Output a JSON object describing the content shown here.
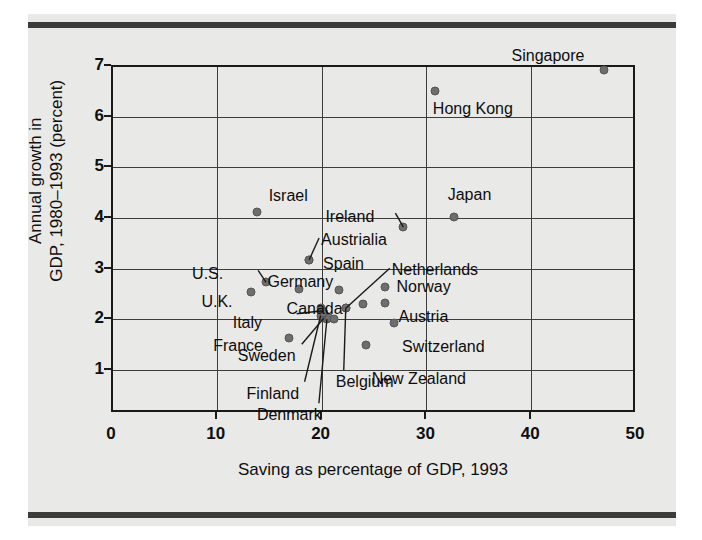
{
  "chart_data": {
    "type": "scatter",
    "title": "",
    "xlabel": "Saving as percentage of GDP, 1993",
    "ylabel": "Annual growth in\nGDP, 1980–1993 (percent)",
    "ylabel_line1": "Annual growth in",
    "ylabel_line2": "GDP, 1980–1993 (percent)",
    "xlim": [
      0,
      50
    ],
    "ylim": [
      0.15,
      7
    ],
    "xticks": [
      0,
      10,
      20,
      30,
      40,
      50
    ],
    "yticks": [
      1,
      2,
      3,
      4,
      5,
      6,
      7
    ],
    "xtick_labels": [
      "0",
      "10",
      "20",
      "30",
      "40",
      "50"
    ],
    "ytick_labels": [
      "1",
      "2",
      "3",
      "4",
      "5",
      "6",
      "7"
    ],
    "grid": true,
    "legend": "none",
    "points": [
      {
        "name": "Singapore",
        "x": 47.0,
        "y": 6.9,
        "label_dx": -92,
        "label_dy": -22,
        "leader": false
      },
      {
        "name": "Hong Kong",
        "x": 30.9,
        "y": 6.48,
        "label_dx": -2,
        "label_dy": 10,
        "leader": false
      },
      {
        "name": "Japan",
        "x": 32.7,
        "y": 4.0,
        "label_dx": -6,
        "label_dy": -30,
        "leader": false
      },
      {
        "name": "Ireland",
        "x": 27.9,
        "y": 3.8,
        "label_dx": -78,
        "label_dy": -18,
        "leader": true,
        "lx": -8,
        "ly": -14
      },
      {
        "name": "Netherlands",
        "x": 22.4,
        "y": 2.2,
        "label_dx": 46,
        "label_dy": -46,
        "leader": true,
        "lx": 44,
        "ly": -40
      },
      {
        "name": "Austrialia",
        "x": 18.9,
        "y": 3.15,
        "label_dx": 12,
        "label_dy": -28,
        "leader": true,
        "lx": 10,
        "ly": -22
      },
      {
        "name": "Spain",
        "x": 18.9,
        "y": 3.15,
        "label_dx": 14,
        "label_dy": -4,
        "leader": false
      },
      {
        "name": "U.S.",
        "x": 14.8,
        "y": 2.71,
        "label_dx": -74,
        "label_dy": -16,
        "leader": true,
        "lx": -8,
        "ly": -12
      },
      {
        "name": "Germany",
        "x": 21.8,
        "y": 2.55,
        "label_dx": -72,
        "label_dy": -16,
        "leader": false
      },
      {
        "name": "Norway",
        "x": 26.1,
        "y": 2.61,
        "label_dx": 12,
        "label_dy": -8,
        "leader": false
      },
      {
        "name": "U.K.",
        "x": 13.4,
        "y": 2.51,
        "label_dx": -50,
        "label_dy": 2,
        "leader": false
      },
      {
        "name": "Canada",
        "x": 17.9,
        "y": 2.57,
        "label_dx": -12,
        "label_dy": 12,
        "leader": false
      },
      {
        "name": "Austria",
        "x": 26.1,
        "y": 2.3,
        "label_dx": 14,
        "label_dy": 6,
        "leader": false
      },
      {
        "name": "Italy",
        "x": 20.2,
        "y": 2.15,
        "label_dx": -90,
        "label_dy": 4,
        "leader": true,
        "lx": -26,
        "ly": 3
      },
      {
        "name": "France",
        "x": 17.0,
        "y": 1.62,
        "label_dx": -76,
        "label_dy": 0,
        "leader": false
      },
      {
        "name": "Switzerland",
        "x": 27.0,
        "y": 1.9,
        "label_dx": 8,
        "label_dy": 16,
        "leader": false
      },
      {
        "name": "Sweden",
        "x": 20.3,
        "y": 2.0,
        "label_dx": -86,
        "label_dy": 30,
        "leader": true,
        "lx": -22,
        "ly": 26
      },
      {
        "name": "New Zealand",
        "x": 24.3,
        "y": 1.48,
        "label_dx": 6,
        "label_dy": 26,
        "leader": false
      },
      {
        "name": "Finland",
        "x": 20.0,
        "y": 2.05,
        "label_dx": -74,
        "label_dy": 70,
        "leader": true,
        "lx": -16,
        "ly": 66
      },
      {
        "name": "Belgium",
        "x": 22.4,
        "y": 2.2,
        "label_dx": -10,
        "label_dy": 66,
        "leader": true,
        "lx": -2,
        "ly": 62
      },
      {
        "name": "Denmark",
        "x": 20.6,
        "y": 1.98,
        "label_dx": -70,
        "label_dy": 88,
        "leader": true,
        "lx": -8,
        "ly": 84
      }
    ],
    "extra_points": [
      {
        "x": 13.9,
        "y": 4.1,
        "name": "Israel"
      },
      {
        "x": 24.0,
        "y": 2.28,
        "name": "unlabeled-cluster-right"
      },
      {
        "x": 20.0,
        "y": 2.2,
        "name": "cluster-a"
      },
      {
        "x": 20.3,
        "y": 2.1,
        "name": "cluster-b"
      },
      {
        "x": 20.8,
        "y": 2.0,
        "name": "cluster-c"
      },
      {
        "x": 21.3,
        "y": 1.98,
        "name": "cluster-d"
      }
    ],
    "israel": {
      "name": "Israel",
      "x": 13.9,
      "y": 4.1
    }
  },
  "axes": {
    "x_title": "Saving as percentage of GDP, 1993",
    "y_title_line1": "Annual growth in",
    "y_title_line2": "GDP, 1980–1993 (percent)"
  },
  "colors": {
    "background": "#e9e9e7",
    "dot": "#6e6e6e",
    "axis": "#1a1a1a",
    "grid": "#3d3d3d",
    "rule": "#3b3b3b",
    "text": "#0d0d0d"
  }
}
